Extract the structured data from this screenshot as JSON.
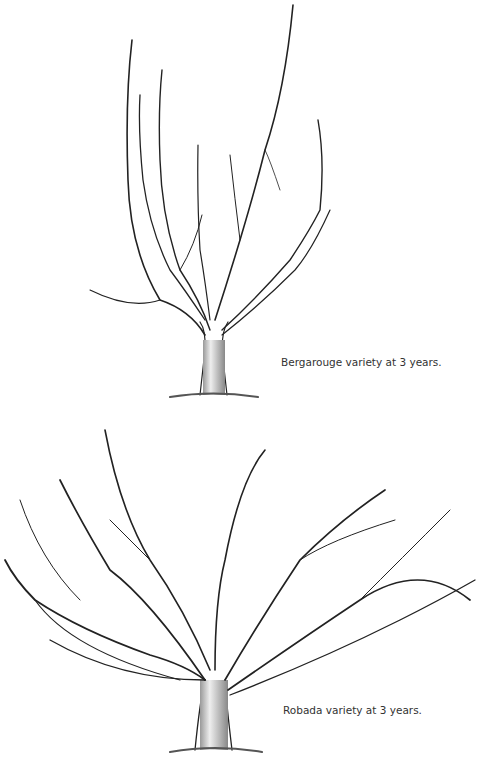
{
  "figures": [
    {
      "caption": "Bergarouge variety at 3 years."
    },
    {
      "caption": "Robada variety at 3 years."
    }
  ]
}
